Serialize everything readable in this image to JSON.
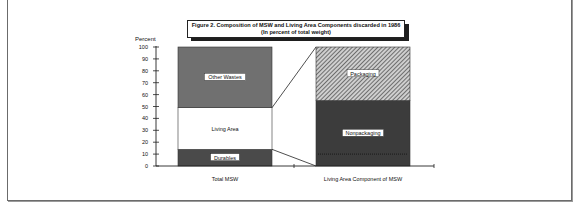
{
  "chart_data": {
    "type": "bar",
    "stacked": true,
    "title": "Figure 2.  Composition of MSW and Living Area Components discarded in 1986",
    "subtitle": "(In percent of total weight)",
    "ylabel": "Percent",
    "xlabel": "",
    "ylim": [
      0,
      100
    ],
    "yticks": [
      0,
      10,
      20,
      30,
      40,
      50,
      60,
      70,
      80,
      90,
      100
    ],
    "grid": false,
    "categories": [
      "Total MSW",
      "Living Area Component of MSW"
    ],
    "bars": [
      {
        "category": "Total MSW",
        "segments": [
          {
            "name": "Durables",
            "value": 14,
            "color": "#4a4a4a",
            "pattern": "solid-dark",
            "label_boxed": true
          },
          {
            "name": "Living Area",
            "value": 35,
            "color": "#ffffff",
            "pattern": "none",
            "label_boxed": false
          },
          {
            "name": "Other Wastes",
            "value": 51,
            "color": "#707070",
            "pattern": "solid-mid",
            "label_boxed": true
          }
        ]
      },
      {
        "category": "Living Area Component of MSW",
        "segments": [
          {
            "name": "Nonpackaging",
            "value": 55,
            "color": "#3c3c3c",
            "pattern": "solid-dark",
            "label_boxed": true
          },
          {
            "name": "Packaging",
            "value": 45,
            "color": "#9a9a9a",
            "pattern": "hatch",
            "label_boxed": true
          }
        ]
      }
    ],
    "connectors": {
      "from_category": "Total MSW",
      "to_category": "Living Area Component of MSW",
      "from_range": [
        14,
        49
      ],
      "to_range": [
        0,
        100
      ]
    }
  }
}
